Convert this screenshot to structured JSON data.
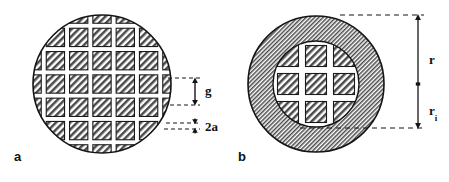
{
  "figure": {
    "background_color": "#ffffff",
    "line_color": "#111111",
    "hatch_color": "#555555",
    "gap_color": "#ffffff",
    "width": 449,
    "height": 182
  },
  "panels": [
    {
      "id": "a",
      "label": "a",
      "label_position": {
        "x": 14,
        "y": 150
      },
      "description": "Circular disc filled with a square mesh of hatched pads separated by narrow gaps",
      "circle": {
        "cx": 102,
        "cy": 84,
        "r": 70
      },
      "grid": {
        "pitch": 23.3,
        "bar_width": 5,
        "pad_size": 18.3,
        "columns": 6,
        "rows": 6,
        "fill": "diagonal-hatch"
      },
      "dimensions": [
        {
          "name": "g",
          "label": "g",
          "meaning": "pad (mesh opening) width",
          "orientation": "vertical",
          "arrow": {
            "x": 195,
            "y_top": 78,
            "y_bottom": 105
          },
          "leaders": [
            {
              "x1": 168,
              "y1": 78,
              "x2": 200,
              "y2": 78
            },
            {
              "x1": 170,
              "y1": 105,
              "x2": 200,
              "y2": 105
            }
          ],
          "label_position": {
            "x": 205,
            "y": 84
          }
        },
        {
          "name": "2a",
          "label": "2a",
          "meaning": "bar (septum) full width",
          "orientation": "vertical",
          "arrow": {
            "x": 195,
            "y_top": 119,
            "y_bottom": 133
          },
          "leaders": [
            {
              "x1": 166,
              "y1": 123,
              "x2": 200,
              "y2": 123
            },
            {
              "x1": 164,
              "y1": 129,
              "x2": 200,
              "y2": 129
            }
          ],
          "label_position": {
            "x": 205,
            "y": 120
          }
        }
      ]
    },
    {
      "id": "b",
      "label": "b",
      "label_position": {
        "x": 238,
        "y": 150
      },
      "description": "Circular disc with a solid hatched annulus and a central grid region",
      "outer_circle": {
        "cx": 316,
        "cy": 84,
        "r": 69
      },
      "inner_circle": {
        "cx": 316,
        "cy": 84,
        "r": 44
      },
      "grid": {
        "pitch": 28,
        "bar_width": 7,
        "pad_size": 21,
        "columns": 3,
        "rows": 3,
        "fill": "diagonal-hatch"
      },
      "dimensions": [
        {
          "name": "r",
          "label": "r",
          "meaning": "outer radius of the disc",
          "orientation": "vertical",
          "arrow": {
            "x": 418,
            "y_top": 15,
            "y_bottom": 84
          },
          "leaders": [
            {
              "x1": 340,
              "y1": 15,
              "x2": 424,
              "y2": 15
            }
          ],
          "label_position": {
            "x": 429,
            "y": 53
          }
        },
        {
          "name": "r_i",
          "label": "r",
          "subscript": "i",
          "meaning": "inner radius of the grid region",
          "orientation": "vertical",
          "arrow": {
            "x": 418,
            "y_top": 84,
            "y_bottom": 128
          },
          "leaders": [
            {
              "x1": 300,
              "y1": 128,
              "x2": 424,
              "y2": 128
            }
          ],
          "label_position": {
            "x": 429,
            "y": 104
          }
        }
      ],
      "center_tick": {
        "x": 418,
        "y": 84
      }
    }
  ],
  "labels": {
    "panel_a": "a",
    "panel_b": "b",
    "gap": "g",
    "bar": "2a",
    "radius_outer": "r",
    "radius_inner": "r",
    "radius_inner_subscript": "i"
  }
}
